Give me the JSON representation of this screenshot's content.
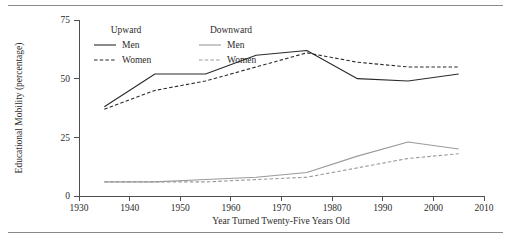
{
  "figure": {
    "has_top_rule": true,
    "has_bottom_rule": true,
    "rule_color": "#8a8a8a"
  },
  "chart_data": {
    "type": "line",
    "title": "",
    "xlabel": "Year Turned Twenty-Five Years Old",
    "ylabel": "Educational Mobility (percentage)",
    "xlim": [
      1930,
      2010
    ],
    "ylim": [
      0,
      75
    ],
    "xticks": [
      1930,
      1940,
      1950,
      1960,
      1970,
      1980,
      1990,
      2000,
      2010
    ],
    "xticklabels": [
      "1930",
      "1940",
      "1950",
      "1960",
      "1970",
      "1980",
      "1990",
      "2000",
      "2010"
    ],
    "yticks": [
      0,
      25,
      50,
      75
    ],
    "yticklabels": [
      "0",
      "25",
      "50",
      "75"
    ],
    "grid": false,
    "legend_position": "upper-left-inside",
    "legend_groups": [
      {
        "heading": "Upward",
        "items": [
          {
            "label": "Men",
            "style": "solid",
            "color": "#2b2b2b"
          },
          {
            "label": "Women",
            "style": "dashed",
            "color": "#2b2b2b"
          }
        ]
      },
      {
        "heading": "Downward",
        "items": [
          {
            "label": "Men",
            "style": "solid",
            "color": "#9a9a9a"
          },
          {
            "label": "Women",
            "style": "dashed",
            "color": "#9a9a9a"
          }
        ]
      }
    ],
    "x": [
      1935,
      1945,
      1955,
      1965,
      1975,
      1985,
      1995,
      2005
    ],
    "series": [
      {
        "name": "Upward Men",
        "group": "Upward",
        "sex": "Men",
        "style": "solid",
        "color": "#2b2b2b",
        "width": 1.1,
        "values": [
          38,
          52,
          52,
          60,
          62,
          50,
          49,
          52
        ]
      },
      {
        "name": "Upward Women",
        "group": "Upward",
        "sex": "Women",
        "style": "dashed",
        "color": "#2b2b2b",
        "width": 1.1,
        "values": [
          37,
          45,
          49,
          55,
          61,
          57,
          55,
          55
        ]
      },
      {
        "name": "Downward Men",
        "group": "Downward",
        "sex": "Men",
        "style": "solid",
        "color": "#9a9a9a",
        "width": 1.1,
        "values": [
          6,
          6,
          7,
          8,
          10,
          17,
          23,
          20
        ]
      },
      {
        "name": "Downward Women",
        "group": "Downward",
        "sex": "Women",
        "style": "dashed",
        "color": "#9a9a9a",
        "width": 1.1,
        "values": [
          6,
          6,
          6,
          7,
          8,
          12,
          16,
          18
        ]
      }
    ]
  }
}
